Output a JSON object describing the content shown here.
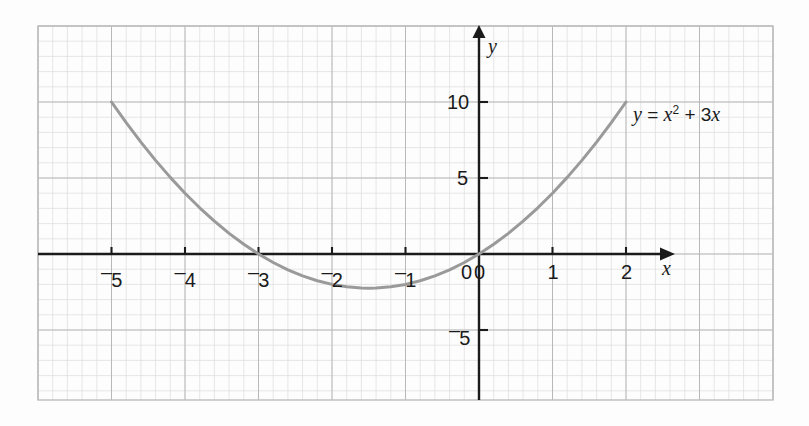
{
  "chart_data": {
    "type": "line",
    "title": "",
    "subtitle": "",
    "xlabel": "x",
    "ylabel": "y",
    "annotation": "y = x² + 3x",
    "equation_parts": {
      "lhs": "y",
      "equals": "=",
      "term1_base": "x",
      "term1_exp": "2",
      "plus": "+",
      "term2": "3x"
    },
    "xlim": [
      -5.98,
      4.0
    ],
    "ylim": [
      -9.6,
      14.9
    ],
    "xticks": [
      -5,
      -4,
      -3,
      -2,
      -1,
      0,
      1,
      2
    ],
    "xtick_labels": [
      "⁻5",
      "⁻4",
      "⁻3",
      "⁻2",
      "⁻1",
      "0",
      "1",
      "2"
    ],
    "yticks": [
      -5,
      5,
      10
    ],
    "ytick_labels": [
      "⁻5",
      "5",
      "10"
    ],
    "grid": true,
    "grid_minor_step_x": 0.2,
    "grid_minor_step_y": 1,
    "grid_major_step_x": 1,
    "grid_major_step_y": 5,
    "legend_position": "none",
    "series": [
      {
        "name": "y = x² + 3x",
        "color": "#9a9a9a",
        "x": [
          -5,
          -4.8,
          -4.6,
          -4.4,
          -4.2,
          -4,
          -3.8,
          -3.6,
          -3.4,
          -3.2,
          -3,
          -2.8,
          -2.6,
          -2.4,
          -2.2,
          -2,
          -1.8,
          -1.6,
          -1.5,
          -1.4,
          -1.2,
          -1,
          -0.8,
          -0.6,
          -0.4,
          -0.2,
          0,
          0.2,
          0.4,
          0.6,
          0.8,
          1,
          1.2,
          1.4,
          1.6,
          1.8,
          2
        ],
        "y": [
          10,
          8.64,
          7.36,
          6.16,
          5.04,
          4,
          3.04,
          2.16,
          1.36,
          0.64,
          0,
          -0.56,
          -1.04,
          -1.44,
          -1.76,
          -2,
          -2.16,
          -2.24,
          -2.25,
          -2.24,
          -2.16,
          -2,
          -1.76,
          -1.44,
          -1.04,
          -0.56,
          0,
          0.64,
          1.36,
          2.16,
          3.04,
          4,
          5.04,
          6.16,
          7.36,
          8.64,
          10
        ]
      }
    ],
    "key_points": {
      "roots": [
        -3,
        0
      ],
      "vertex": [
        -1.5,
        -2.25
      ],
      "endpoints": [
        [
          -5,
          10
        ],
        [
          2,
          10
        ]
      ]
    },
    "colors": {
      "curve": "#9a9a9a",
      "axis": "#1b1b1b",
      "grid_major": "#b6b6b6",
      "grid_minor": "#d8d8d8",
      "frame": "#bdbdbd",
      "background": "#fdfdfd",
      "text": "#1b1b1b"
    }
  }
}
